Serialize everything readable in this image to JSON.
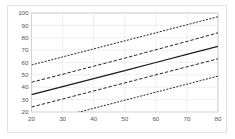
{
  "chart_data": {
    "type": "line",
    "title": "",
    "subtitle": "",
    "xlabel": "",
    "ylabel": "",
    "xlim": [
      20,
      80
    ],
    "ylim": [
      20,
      100
    ],
    "xticks": [
      20,
      30,
      40,
      50,
      60,
      70,
      80
    ],
    "yticks": [
      20,
      30,
      40,
      50,
      60,
      70,
      80,
      90,
      100
    ],
    "xtick_labels": [
      "20",
      "30",
      "40",
      "50",
      "60",
      "70",
      "80"
    ],
    "ytick_labels": [
      "20",
      "30",
      "40",
      "50",
      "60",
      "70",
      "80",
      "90",
      "100"
    ],
    "grid": true,
    "grid_color": "#e8e8e8",
    "legend": null,
    "legend_position": "none",
    "background_color": "#ffffff",
    "border_color": "#c9c9c9",
    "x": [
      20,
      30,
      40,
      50,
      60,
      70,
      80
    ],
    "series": [
      {
        "name": "upper prediction bound",
        "style": "dotted",
        "color": "#1a1a1a",
        "values": [
          58.0,
          64.5,
          71.0,
          77.5,
          84.0,
          90.5,
          97.0
        ]
      },
      {
        "name": "upper confidence bound",
        "style": "dashed",
        "color": "#1a1a1a",
        "values": [
          44.0,
          50.5,
          57.0,
          63.5,
          70.3,
          77.0,
          84.0
        ]
      },
      {
        "name": "fitted regression line",
        "style": "solid",
        "color": "#1a1a1a",
        "values": [
          34.0,
          40.5,
          47.0,
          53.5,
          60.0,
          66.5,
          73.0
        ]
      },
      {
        "name": "lower confidence bound",
        "style": "dashed",
        "color": "#1a1a1a",
        "values": [
          24.0,
          30.5,
          37.0,
          43.5,
          50.0,
          56.5,
          63.0
        ]
      },
      {
        "name": "lower prediction bound",
        "style": "dotted",
        "color": "#1a1a1a",
        "values": [
          10.0,
          16.5,
          23.0,
          29.5,
          36.0,
          42.5,
          49.0
        ]
      }
    ]
  }
}
